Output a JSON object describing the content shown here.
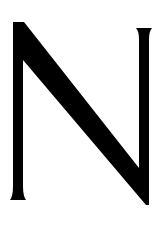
{
  "glyph": {
    "character": "N",
    "color": "#000000",
    "background": "#ffffff"
  }
}
